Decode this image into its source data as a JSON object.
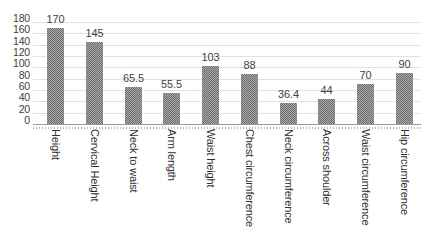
{
  "chart_data": {
    "type": "bar",
    "title": "",
    "subtitle": "",
    "xlabel": "",
    "ylabel": "",
    "ylim": [
      0,
      180
    ],
    "grid": true,
    "legend": false,
    "legend_position": "none",
    "orientation": "vertical",
    "bar_color": "#8a8a8a",
    "bar_pattern": "checkered-dither",
    "gridline_color": "#e2e2e2",
    "axis_color": "#9a9a9a",
    "label_rotation_degrees": 90,
    "data_labels_shown": true,
    "y_ticks": [
      0,
      20,
      40,
      60,
      80,
      100,
      120,
      140,
      160,
      180
    ],
    "y_tick_labels": [
      "0",
      "20",
      "40",
      "60",
      "80",
      "100",
      "120",
      "140",
      "160",
      "180"
    ],
    "categories": [
      "Height",
      "Cervical Height",
      "Neck to waist",
      "Arm length",
      "Waist height",
      "Chest circumference",
      "Neck circumference",
      "Across shoulder",
      "Waist circumference",
      "Hip circumference"
    ],
    "values": [
      170,
      145,
      65.5,
      55.5,
      103,
      88,
      36.4,
      44,
      70,
      90
    ],
    "value_labels": [
      "170",
      "145",
      "65.5",
      "55.5",
      "103",
      "88",
      "36.4",
      "44",
      "70",
      "90"
    ]
  }
}
